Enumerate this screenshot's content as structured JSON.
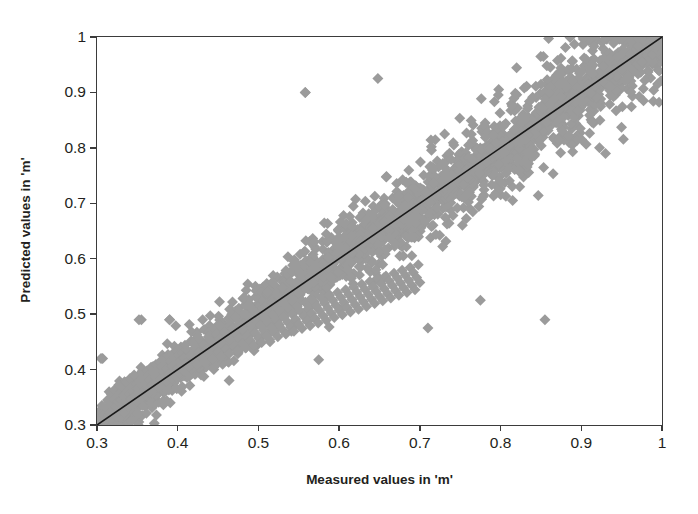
{
  "chart_data": {
    "type": "scatter",
    "title": "",
    "xlabel": "Measured values in 'm'",
    "ylabel": "Predicted values in 'm'",
    "xlim": [
      0.3,
      1.0
    ],
    "ylim": [
      0.3,
      1.0
    ],
    "xticks": [
      "0.3",
      "0.4",
      "0.5",
      "0.6",
      "0.7",
      "0.8",
      "0.9",
      "1"
    ],
    "yticks": [
      "0.3",
      "0.4",
      "0.5",
      "0.6",
      "0.7",
      "0.8",
      "0.9",
      "1"
    ],
    "xtick_values": [
      0.3,
      0.4,
      0.5,
      0.6,
      0.7,
      0.8,
      0.9,
      1.0
    ],
    "ytick_values": [
      0.3,
      0.4,
      0.5,
      0.6,
      0.7,
      0.8,
      0.9,
      1.0
    ],
    "grid": false,
    "legend": "none",
    "marker": {
      "shape": "diamond",
      "color": "#9b9b9b",
      "size_px": 11
    },
    "reference_line": {
      "name": "1:1 line",
      "color": "#1a1a1a",
      "width_px": 1.6,
      "from": [
        0.3,
        0.3
      ],
      "to": [
        1.0,
        1.0
      ]
    },
    "series": [
      {
        "name": "Measured vs Predicted",
        "points": [
          [
            0.302,
            0.305
          ],
          [
            0.305,
            0.312
          ],
          [
            0.306,
            0.335
          ],
          [
            0.307,
            0.42
          ],
          [
            0.308,
            0.318
          ],
          [
            0.31,
            0.308
          ],
          [
            0.312,
            0.33
          ],
          [
            0.313,
            0.345
          ],
          [
            0.314,
            0.318
          ],
          [
            0.315,
            0.36
          ],
          [
            0.316,
            0.322
          ],
          [
            0.317,
            0.34
          ],
          [
            0.318,
            0.355
          ],
          [
            0.319,
            0.312
          ],
          [
            0.32,
            0.328
          ],
          [
            0.321,
            0.346
          ],
          [
            0.322,
            0.364
          ],
          [
            0.323,
            0.333
          ],
          [
            0.324,
            0.316
          ],
          [
            0.325,
            0.352
          ],
          [
            0.326,
            0.341
          ],
          [
            0.327,
            0.372
          ],
          [
            0.328,
            0.327
          ],
          [
            0.329,
            0.358
          ],
          [
            0.33,
            0.345
          ],
          [
            0.331,
            0.336
          ],
          [
            0.332,
            0.368
          ],
          [
            0.333,
            0.353
          ],
          [
            0.334,
            0.322
          ],
          [
            0.335,
            0.349
          ],
          [
            0.336,
            0.377
          ],
          [
            0.337,
            0.34
          ],
          [
            0.338,
            0.362
          ],
          [
            0.339,
            0.331
          ],
          [
            0.34,
            0.356
          ],
          [
            0.341,
            0.384
          ],
          [
            0.342,
            0.347
          ],
          [
            0.343,
            0.369
          ],
          [
            0.344,
            0.338
          ],
          [
            0.345,
            0.36
          ],
          [
            0.346,
            0.39
          ],
          [
            0.347,
            0.352
          ],
          [
            0.348,
            0.374
          ],
          [
            0.349,
            0.343
          ],
          [
            0.35,
            0.366
          ],
          [
            0.351,
            0.3
          ],
          [
            0.352,
            0.357
          ],
          [
            0.353,
            0.379
          ],
          [
            0.354,
            0.348
          ],
          [
            0.355,
            0.49
          ],
          [
            0.356,
            0.371
          ],
          [
            0.357,
            0.393
          ],
          [
            0.358,
            0.362
          ],
          [
            0.359,
            0.385
          ],
          [
            0.36,
            0.354
          ],
          [
            0.361,
            0.376
          ],
          [
            0.362,
            0.398
          ],
          [
            0.363,
            0.367
          ],
          [
            0.364,
            0.39
          ],
          [
            0.365,
            0.359
          ],
          [
            0.366,
            0.381
          ],
          [
            0.367,
            0.404
          ],
          [
            0.368,
            0.372
          ],
          [
            0.369,
            0.395
          ],
          [
            0.37,
            0.364
          ],
          [
            0.371,
            0.303
          ],
          [
            0.372,
            0.386
          ],
          [
            0.373,
            0.409
          ],
          [
            0.374,
            0.377
          ],
          [
            0.375,
            0.4
          ],
          [
            0.376,
            0.369
          ],
          [
            0.377,
            0.391
          ],
          [
            0.378,
            0.414
          ],
          [
            0.379,
            0.382
          ],
          [
            0.38,
            0.405
          ],
          [
            0.381,
            0.374
          ],
          [
            0.382,
            0.396
          ],
          [
            0.383,
            0.419
          ],
          [
            0.384,
            0.387
          ],
          [
            0.385,
            0.41
          ],
          [
            0.386,
            0.379
          ],
          [
            0.387,
            0.401
          ],
          [
            0.388,
            0.424
          ],
          [
            0.389,
            0.392
          ],
          [
            0.39,
            0.49
          ],
          [
            0.391,
            0.415
          ],
          [
            0.392,
            0.384
          ],
          [
            0.393,
            0.406
          ],
          [
            0.394,
            0.429
          ],
          [
            0.395,
            0.397
          ],
          [
            0.396,
            0.42
          ],
          [
            0.397,
            0.389
          ],
          [
            0.398,
            0.411
          ],
          [
            0.399,
            0.434
          ],
          [
            0.4,
            0.402
          ],
          [
            0.401,
            0.425
          ],
          [
            0.402,
            0.394
          ],
          [
            0.403,
            0.416
          ],
          [
            0.404,
            0.439
          ],
          [
            0.405,
            0.407
          ],
          [
            0.406,
            0.43
          ],
          [
            0.407,
            0.399
          ],
          [
            0.408,
            0.421
          ],
          [
            0.409,
            0.444
          ],
          [
            0.41,
            0.412
          ],
          [
            0.412,
            0.435
          ],
          [
            0.414,
            0.404
          ],
          [
            0.416,
            0.426
          ],
          [
            0.418,
            0.449
          ],
          [
            0.42,
            0.417
          ],
          [
            0.422,
            0.44
          ],
          [
            0.424,
            0.409
          ],
          [
            0.426,
            0.431
          ],
          [
            0.428,
            0.454
          ],
          [
            0.43,
            0.422
          ],
          [
            0.432,
            0.445
          ],
          [
            0.434,
            0.414
          ],
          [
            0.436,
            0.436
          ],
          [
            0.438,
            0.459
          ],
          [
            0.44,
            0.427
          ],
          [
            0.442,
            0.45
          ],
          [
            0.444,
            0.419
          ],
          [
            0.446,
            0.441
          ],
          [
            0.448,
            0.464
          ],
          [
            0.45,
            0.432
          ],
          [
            0.452,
            0.455
          ],
          [
            0.454,
            0.424
          ],
          [
            0.456,
            0.446
          ],
          [
            0.458,
            0.469
          ],
          [
            0.46,
            0.437
          ],
          [
            0.462,
            0.46
          ],
          [
            0.464,
            0.429
          ],
          [
            0.466,
            0.451
          ],
          [
            0.468,
            0.474
          ],
          [
            0.47,
            0.442
          ],
          [
            0.472,
            0.465
          ],
          [
            0.474,
            0.434
          ],
          [
            0.476,
            0.456
          ],
          [
            0.478,
            0.479
          ],
          [
            0.48,
            0.447
          ],
          [
            0.482,
            0.47
          ],
          [
            0.484,
            0.439
          ],
          [
            0.486,
            0.461
          ],
          [
            0.488,
            0.484
          ],
          [
            0.49,
            0.452
          ],
          [
            0.492,
            0.475
          ],
          [
            0.494,
            0.444
          ],
          [
            0.496,
            0.466
          ],
          [
            0.498,
            0.489
          ],
          [
            0.5,
            0.457
          ],
          [
            0.502,
            0.48
          ],
          [
            0.504,
            0.449
          ],
          [
            0.506,
            0.471
          ],
          [
            0.508,
            0.494
          ],
          [
            0.51,
            0.462
          ],
          [
            0.512,
            0.485
          ],
          [
            0.514,
            0.454
          ],
          [
            0.516,
            0.476
          ],
          [
            0.518,
            0.499
          ],
          [
            0.52,
            0.467
          ],
          [
            0.522,
            0.49
          ],
          [
            0.524,
            0.459
          ],
          [
            0.526,
            0.481
          ],
          [
            0.528,
            0.504
          ],
          [
            0.53,
            0.472
          ],
          [
            0.532,
            0.495
          ],
          [
            0.534,
            0.464
          ],
          [
            0.536,
            0.486
          ],
          [
            0.538,
            0.509
          ],
          [
            0.54,
            0.477
          ],
          [
            0.542,
            0.5
          ],
          [
            0.544,
            0.469
          ],
          [
            0.546,
            0.491
          ],
          [
            0.548,
            0.514
          ],
          [
            0.55,
            0.482
          ],
          [
            0.552,
            0.505
          ],
          [
            0.554,
            0.474
          ],
          [
            0.556,
            0.496
          ],
          [
            0.558,
            0.9
          ],
          [
            0.56,
            0.487
          ],
          [
            0.562,
            0.51
          ],
          [
            0.564,
            0.479
          ],
          [
            0.566,
            0.501
          ],
          [
            0.568,
            0.524
          ],
          [
            0.57,
            0.492
          ],
          [
            0.572,
            0.515
          ],
          [
            0.574,
            0.484
          ],
          [
            0.576,
            0.506
          ],
          [
            0.578,
            0.529
          ],
          [
            0.58,
            0.497
          ],
          [
            0.582,
            0.52
          ],
          [
            0.584,
            0.489
          ],
          [
            0.586,
            0.511
          ],
          [
            0.588,
            0.534
          ],
          [
            0.59,
            0.502
          ],
          [
            0.592,
            0.525
          ],
          [
            0.594,
            0.494
          ],
          [
            0.596,
            0.516
          ],
          [
            0.598,
            0.539
          ],
          [
            0.6,
            0.507
          ],
          [
            0.602,
            0.53
          ],
          [
            0.604,
            0.499
          ],
          [
            0.606,
            0.521
          ],
          [
            0.608,
            0.544
          ],
          [
            0.61,
            0.512
          ],
          [
            0.612,
            0.535
          ],
          [
            0.614,
            0.504
          ],
          [
            0.616,
            0.526
          ],
          [
            0.618,
            0.549
          ],
          [
            0.62,
            0.517
          ],
          [
            0.622,
            0.54
          ],
          [
            0.624,
            0.509
          ],
          [
            0.626,
            0.531
          ],
          [
            0.628,
            0.554
          ],
          [
            0.63,
            0.522
          ],
          [
            0.632,
            0.545
          ],
          [
            0.634,
            0.514
          ],
          [
            0.636,
            0.536
          ],
          [
            0.638,
            0.559
          ],
          [
            0.64,
            0.527
          ],
          [
            0.642,
            0.55
          ],
          [
            0.644,
            0.519
          ],
          [
            0.646,
            0.541
          ],
          [
            0.648,
            0.564
          ],
          [
            0.65,
            0.532
          ],
          [
            0.652,
            0.555
          ],
          [
            0.654,
            0.524
          ],
          [
            0.656,
            0.546
          ],
          [
            0.658,
            0.569
          ],
          [
            0.66,
            0.537
          ],
          [
            0.662,
            0.56
          ],
          [
            0.664,
            0.529
          ],
          [
            0.666,
            0.551
          ],
          [
            0.668,
            0.574
          ],
          [
            0.67,
            0.542
          ],
          [
            0.672,
            0.565
          ],
          [
            0.674,
            0.534
          ],
          [
            0.676,
            0.556
          ],
          [
            0.678,
            0.579
          ],
          [
            0.68,
            0.547
          ],
          [
            0.682,
            0.57
          ],
          [
            0.684,
            0.539
          ],
          [
            0.686,
            0.561
          ],
          [
            0.688,
            0.584
          ],
          [
            0.69,
            0.552
          ],
          [
            0.692,
            0.575
          ],
          [
            0.694,
            0.544
          ],
          [
            0.696,
            0.566
          ],
          [
            0.698,
            0.589
          ],
          [
            0.7,
            0.557
          ]
        ],
        "count_approx": 1800,
        "note": "dense elongated cloud along the 1:1 line from (0.30,0.30) to (1.0,1.0)"
      }
    ],
    "outliers": [
      [
        0.305,
        0.42
      ],
      [
        0.352,
        0.49
      ],
      [
        0.39,
        0.49
      ],
      [
        0.558,
        0.9
      ],
      [
        0.648,
        0.925
      ],
      [
        0.855,
        0.49
      ],
      [
        0.71,
        0.475
      ],
      [
        0.775,
        0.525
      ],
      [
        0.93,
        0.79
      ],
      [
        0.975,
        0.955
      ]
    ]
  },
  "axes": {
    "x_title": "Measured values in 'm'",
    "y_title": "Predicted values in 'm'",
    "x_tick_labels": [
      "0.3",
      "0.4",
      "0.5",
      "0.6",
      "0.7",
      "0.8",
      "0.9",
      "1"
    ],
    "y_tick_labels": [
      "0.3",
      "0.4",
      "0.5",
      "0.6",
      "0.7",
      "0.8",
      "0.9",
      "1"
    ]
  },
  "colors": {
    "marker": "#9b9b9b",
    "line": "#1a1a1a",
    "axis": "#3b3b3b",
    "text": "#231f20",
    "background": "#ffffff"
  }
}
